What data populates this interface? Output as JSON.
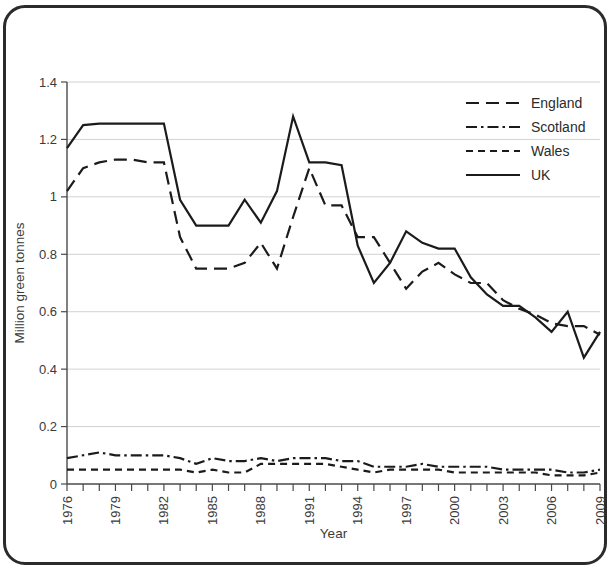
{
  "chart_data": {
    "type": "line",
    "title": "",
    "xlabel": "Year",
    "ylabel": "Million green tonnes",
    "xlim": [
      1976,
      2009
    ],
    "ylim": [
      0,
      1.4
    ],
    "ytick_values": [
      0,
      0.2,
      0.4,
      0.6,
      0.8,
      1,
      1.2,
      1.4
    ],
    "ytick_labels": [
      "0",
      "0.2",
      "0.4",
      "0.6",
      "0.8",
      "1",
      "1.2",
      "1.4"
    ],
    "xtick_values": [
      1976,
      1979,
      1982,
      1985,
      1988,
      1991,
      1994,
      1997,
      2000,
      2003,
      2006,
      2009
    ],
    "xtick_labels": [
      "1976",
      "1979",
      "1982",
      "1985",
      "1988",
      "1991",
      "1994",
      "1997",
      "2000",
      "2003",
      "2006",
      "2009"
    ],
    "x": [
      1976,
      1977,
      1978,
      1979,
      1980,
      1981,
      1982,
      1983,
      1984,
      1985,
      1986,
      1987,
      1988,
      1989,
      1990,
      1991,
      1992,
      1993,
      1994,
      1995,
      1996,
      1997,
      1998,
      1999,
      2000,
      2001,
      2002,
      2003,
      2004,
      2005,
      2006,
      2007,
      2008,
      2009
    ],
    "grid": "horizontal",
    "legend_position": "top-right",
    "series": [
      {
        "name": "England",
        "dash": "long-dash",
        "values": [
          1.02,
          1.1,
          1.12,
          1.13,
          1.13,
          1.12,
          1.12,
          0.86,
          0.75,
          0.75,
          0.75,
          0.77,
          0.84,
          0.75,
          0.93,
          1.1,
          0.97,
          0.97,
          0.86,
          0.86,
          0.77,
          0.68,
          0.74,
          0.77,
          0.73,
          0.7,
          0.7,
          0.64,
          0.61,
          0.59,
          0.56,
          0.55,
          0.55,
          0.52
        ]
      },
      {
        "name": "Scotland",
        "dash": "dash-dot",
        "values": [
          0.09,
          0.1,
          0.11,
          0.1,
          0.1,
          0.1,
          0.1,
          0.09,
          0.07,
          0.09,
          0.08,
          0.08,
          0.09,
          0.08,
          0.09,
          0.09,
          0.09,
          0.08,
          0.08,
          0.06,
          0.06,
          0.06,
          0.07,
          0.06,
          0.06,
          0.06,
          0.06,
          0.05,
          0.05,
          0.05,
          0.05,
          0.04,
          0.04,
          0.05
        ]
      },
      {
        "name": "Wales",
        "dash": "short-dash",
        "values": [
          0.05,
          0.05,
          0.05,
          0.05,
          0.05,
          0.05,
          0.05,
          0.05,
          0.04,
          0.05,
          0.04,
          0.04,
          0.07,
          0.07,
          0.07,
          0.07,
          0.07,
          0.06,
          0.05,
          0.04,
          0.05,
          0.05,
          0.05,
          0.05,
          0.04,
          0.04,
          0.04,
          0.04,
          0.04,
          0.04,
          0.03,
          0.03,
          0.03,
          0.04
        ]
      },
      {
        "name": "UK",
        "dash": "solid",
        "values": [
          1.17,
          1.25,
          1.255,
          1.255,
          1.255,
          1.255,
          1.255,
          0.99,
          0.9,
          0.9,
          0.9,
          0.99,
          0.91,
          1.02,
          1.28,
          1.12,
          1.12,
          1.11,
          0.83,
          0.7,
          0.77,
          0.88,
          0.84,
          0.82,
          0.82,
          0.72,
          0.66,
          0.62,
          0.62,
          0.58,
          0.53,
          0.6,
          0.44,
          0.53
        ]
      }
    ],
    "series_actual": {
      "England": [
        1.02,
        1.1,
        1.12,
        1.13,
        1.13,
        1.12,
        1.12,
        0.86,
        0.75,
        0.75,
        0.75,
        0.77,
        0.84,
        0.75,
        0.93,
        1.1,
        0.97,
        0.97,
        0.86,
        0.86,
        0.77,
        0.68,
        0.74,
        0.77,
        0.73,
        0.7,
        0.7,
        0.64,
        0.61,
        0.59,
        0.56,
        0.55,
        0.55,
        0.52
      ],
      "UK": [
        1.17,
        1.25,
        1.255,
        1.255,
        1.255,
        1.255,
        1.255,
        0.99,
        0.9,
        0.9,
        0.9,
        0.99,
        0.91,
        1.02,
        1.28,
        1.12,
        1.12,
        1.11,
        0.83,
        0.7,
        0.77,
        0.88,
        0.84,
        0.82,
        0.82,
        0.72,
        0.66,
        0.62,
        0.62,
        0.58,
        0.53,
        0.6,
        0.44,
        0.53
      ]
    }
  },
  "legend": {
    "items": [
      {
        "label": "England",
        "style": "long-dash"
      },
      {
        "label": "Scotland",
        "style": "dash-dot"
      },
      {
        "label": "Wales",
        "style": "short-dash"
      },
      {
        "label": "UK",
        "style": "solid"
      }
    ]
  },
  "axes": {
    "y_title": "Million green tonnes",
    "x_title": "Year"
  }
}
